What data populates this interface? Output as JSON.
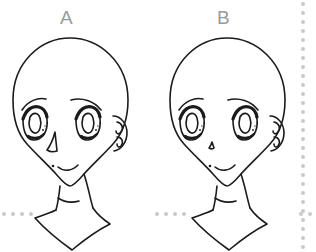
{
  "canvas": {
    "width": 316,
    "height": 252,
    "background": "#ffffff"
  },
  "figures": [
    {
      "id": "figure-a",
      "label": "A",
      "label_color": "#9a9a9a",
      "nose_style": "large-triangular",
      "description": "Front-facing anime head outline with bald skull, eyebrows, large eyes, large triangular nose, small smiling mouth, ear on the right, neck and shoulders"
    },
    {
      "id": "figure-b",
      "label": "B",
      "label_color": "#9a9a9a",
      "nose_style": "small-tick",
      "description": "Front-facing anime head outline with bald skull, eyebrows, large eyes, tiny nose mark, small smiling mouth, ear on the right, neck and shoulders"
    }
  ],
  "guides": {
    "line_color": "#c9c9c9",
    "dot_size": 4,
    "dot_spacing": 9,
    "bottom_line_y": 214,
    "right_line_x": 303
  },
  "line_art": {
    "stroke_color": "#1b1b1b",
    "fill": "none",
    "stroke_width": 1.6
  }
}
